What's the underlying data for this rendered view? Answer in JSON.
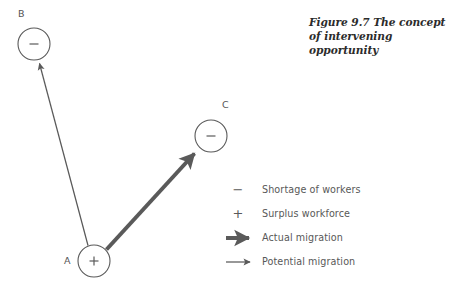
{
  "figure": {
    "caption": "Figure 9.7 The concept of intervening opportunity",
    "background": "#ffffff",
    "stroke_color": "#5a5a5a",
    "text_color": "#585858"
  },
  "nodes": [
    {
      "id": "B",
      "label": "B",
      "sign": "−",
      "cx": 34,
      "cy": 44,
      "r": 16
    },
    {
      "id": "C",
      "label": "C",
      "sign": "−",
      "cx": 211,
      "cy": 136,
      "r": 16
    },
    {
      "id": "A",
      "label": "A",
      "sign": "+",
      "cx": 94,
      "cy": 261,
      "r": 16
    }
  ],
  "arrows": [
    {
      "id": "a-to-b",
      "from": "A",
      "to": "B",
      "kind": "potential",
      "label": "Potential migration"
    },
    {
      "id": "a-to-c",
      "from": "A",
      "to": "C",
      "kind": "actual",
      "label": "Actual migration"
    }
  ],
  "legend": {
    "items": [
      {
        "symbol": "minus",
        "glyph": "−",
        "label": "Shortage of workers"
      },
      {
        "symbol": "plus",
        "glyph": "+",
        "label": "Surplus workforce"
      },
      {
        "symbol": "thick-arrow",
        "glyph": "",
        "label": "Actual migration"
      },
      {
        "symbol": "thin-arrow",
        "glyph": "",
        "label": "Potential migration"
      }
    ]
  }
}
